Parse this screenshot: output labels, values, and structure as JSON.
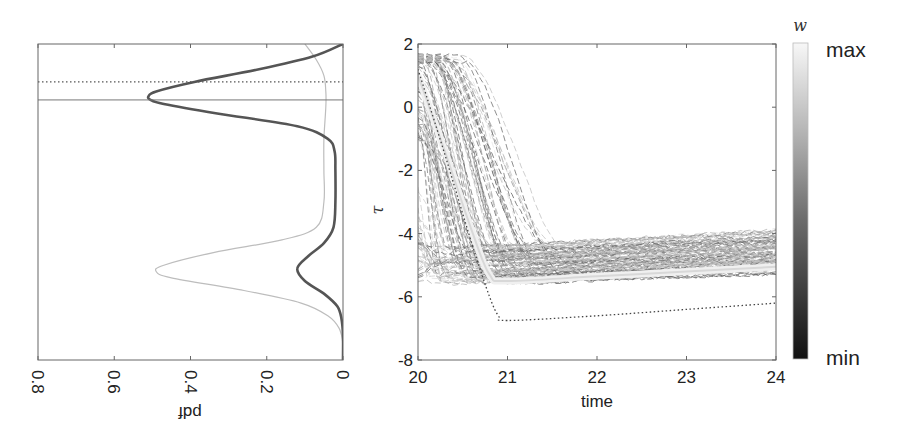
{
  "chart_data": [
    {
      "type": "line",
      "name": "pdf-panel",
      "orientation": "rotated (pdf on reversed horizontal axis, tau on vertical)",
      "xlabel": "pdf",
      "xlabel_rotated": true,
      "x_ticks": [
        "0.8",
        "0.6",
        "0.4",
        "0.2",
        "0"
      ],
      "xlim": [
        0.8,
        0
      ],
      "ylim": [
        -8,
        2
      ],
      "series": [
        {
          "name": "posterior-pdf",
          "style": "thick dark gray",
          "color": "#555555",
          "tau": [
            2.0,
            1.6,
            1.2,
            0.8,
            0.5,
            0.35,
            0.23,
            0.1,
            -0.2,
            -0.6,
            -1.0,
            -1.4,
            -2.0,
            -3.0,
            -3.8,
            -4.3,
            -4.7,
            -5.1,
            -5.5,
            -5.9,
            -6.3,
            -6.7,
            -7.2,
            -8.0
          ],
          "pdf": [
            0.0,
            0.08,
            0.22,
            0.39,
            0.49,
            0.51,
            0.505,
            0.47,
            0.33,
            0.12,
            0.04,
            0.022,
            0.02,
            0.02,
            0.025,
            0.05,
            0.09,
            0.12,
            0.1,
            0.05,
            0.015,
            0.004,
            0.0,
            0.0
          ]
        },
        {
          "name": "prior-pdf",
          "style": "thin light gray",
          "color": "#bdbdbd",
          "tau": [
            2.0,
            1.5,
            1.0,
            0.5,
            0.0,
            -1.0,
            -2.0,
            -3.0,
            -3.8,
            -4.2,
            -4.6,
            -5.0,
            -5.2,
            -5.4,
            -5.8,
            -6.2,
            -6.6,
            -7.0,
            -7.5,
            -8.0
          ],
          "pdf": [
            0.1,
            0.07,
            0.05,
            0.045,
            0.045,
            0.05,
            0.05,
            0.05,
            0.07,
            0.16,
            0.34,
            0.47,
            0.49,
            0.45,
            0.26,
            0.11,
            0.04,
            0.01,
            0.0,
            0.0
          ]
        }
      ],
      "reference_lines": [
        {
          "name": "dotted-reference",
          "style": "dotted",
          "tau": 0.8
        },
        {
          "name": "solid-reference",
          "style": "solid",
          "tau": 0.23
        }
      ]
    },
    {
      "type": "line",
      "name": "trajectories-panel",
      "xlabel": "time",
      "ylabel": "τ",
      "xlim": [
        20,
        24
      ],
      "ylim": [
        -8,
        2
      ],
      "x_ticks": [
        "20",
        "21",
        "22",
        "23",
        "24"
      ],
      "y_ticks": [
        "2",
        "0",
        "-2",
        "-4",
        "-6",
        "-8"
      ],
      "description": "Ensemble of weighted trajectories (dashed, gray shade by weight w) descending from ~1.5 to ~-5 and plateauing between -5.6 and -4.4",
      "ensemble": {
        "count_approx": 120,
        "start_tau_range": [
          -5.6,
          1.6
        ],
        "plateau_tau_range": [
          -5.6,
          -4.4
        ],
        "descent_end_time_range": [
          20.0,
          21.8
        ]
      },
      "reference_series": {
        "name": "dotted-truth",
        "style": "dotted",
        "x": [
          20.0,
          20.3,
          20.6,
          20.8,
          20.9,
          21.0,
          22.0,
          23.0,
          24.0
        ],
        "y": [
          1.2,
          -1.5,
          -4.3,
          -6.0,
          -6.6,
          -6.75,
          -6.6,
          -6.4,
          -6.2
        ]
      },
      "mean_series": {
        "name": "weighted-mean",
        "style": "thick light band",
        "x": [
          20.0,
          20.3,
          20.6,
          20.8,
          21.0,
          22.0,
          23.0,
          24.0
        ],
        "y": [
          1.0,
          -1.4,
          -3.9,
          -5.3,
          -5.5,
          -5.35,
          -5.2,
          -5.05
        ]
      },
      "colorbar": {
        "label": "w",
        "max_label": "max",
        "min_label": "min",
        "colormap": "gray",
        "color_max": "#f7f7f7",
        "color_min": "#111111"
      }
    }
  ]
}
